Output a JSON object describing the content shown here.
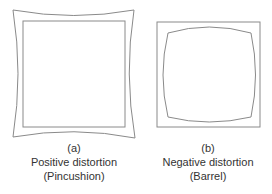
{
  "figure": {
    "panels": [
      {
        "label": "(a)",
        "title": "Positive distortion",
        "subtitle": "(Pincushion)",
        "type": "pincushion"
      },
      {
        "label": "(b)",
        "title": "Negative distortion",
        "subtitle": "(Barrel)",
        "type": "barrel"
      }
    ],
    "colors": {
      "line": "#8a8a8a",
      "text": "#333333",
      "background": "#ffffff"
    }
  }
}
